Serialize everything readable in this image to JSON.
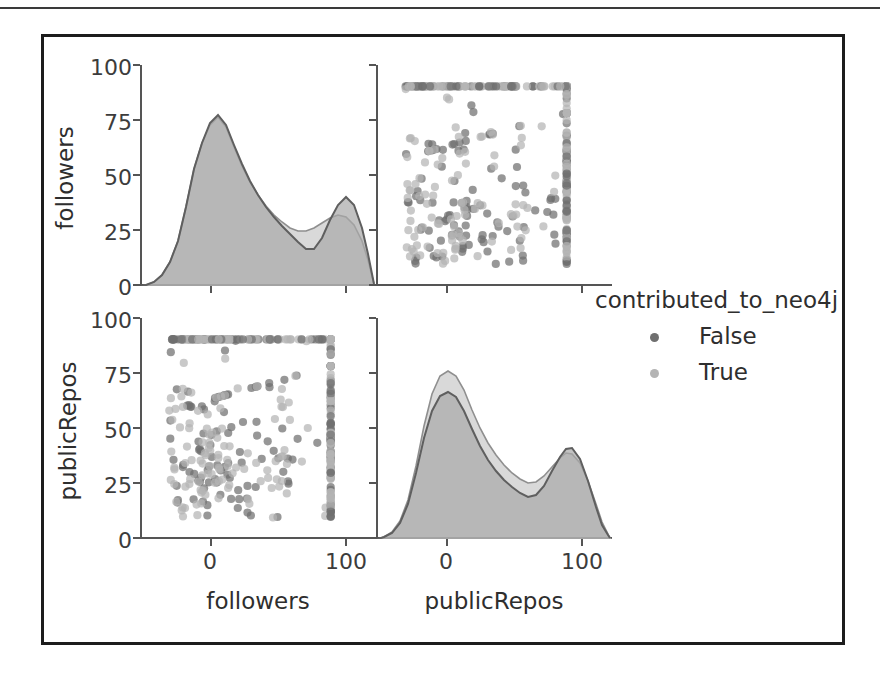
{
  "figure": {
    "kind": "seaborn-pairplot",
    "grid_rows": 2,
    "grid_cols": 2,
    "variables": [
      "followers",
      "publicRepos"
    ],
    "hue": "contributed_to_neo4j"
  },
  "legend": {
    "title": "contributed_to_neo4j",
    "entries": [
      {
        "label": "False",
        "color": "#6f6f6f",
        "marker": "circle"
      },
      {
        "label": "True",
        "color": "#b0b0b0",
        "marker": "circle"
      }
    ]
  },
  "axis_labels": {
    "bottom_left": "followers",
    "bottom_right": "publicRepos",
    "left_top": "followers",
    "left_bottom": "publicRepos"
  },
  "ticks": {
    "x_labels": [
      "0",
      "100"
    ],
    "x_values": [
      0,
      100
    ],
    "y_labels": [
      "0",
      "25",
      "50",
      "75",
      "100"
    ],
    "y_values": [
      0,
      25,
      50,
      75,
      100
    ]
  },
  "chart_data": [
    {
      "id": "panel-0-0",
      "type": "line",
      "subtype": "kde-filled",
      "title": "",
      "xlabel": "followers",
      "ylabel": "followers",
      "xlim": [
        -35,
        140
      ],
      "ylim": [
        0,
        110
      ],
      "grid": false,
      "legend_position": "right-outside",
      "x": [
        -35,
        -25,
        -15,
        -10,
        -5,
        0,
        5,
        10,
        15,
        20,
        25,
        30,
        35,
        40,
        45,
        50,
        55,
        60,
        65,
        70,
        75,
        80,
        85,
        90,
        95,
        100,
        105,
        110,
        115,
        120,
        130,
        140
      ],
      "series": [
        {
          "name": "False",
          "color": "#6f6f6f",
          "values": [
            0,
            1,
            4,
            9,
            20,
            42,
            78,
            99,
            101,
            92,
            78,
            65,
            55,
            47,
            41,
            36,
            31,
            26,
            21,
            16,
            13,
            13,
            18,
            27,
            36,
            40,
            36,
            26,
            15,
            8,
            2,
            0
          ]
        },
        {
          "name": "True",
          "color": "#b0b0b0",
          "values": [
            0,
            1,
            4,
            9,
            20,
            42,
            78,
            99,
            100,
            92,
            79,
            67,
            58,
            50,
            45,
            40,
            35,
            30,
            26,
            22,
            21,
            22,
            25,
            28,
            29,
            28,
            24,
            18,
            11,
            6,
            2,
            0
          ]
        }
      ]
    },
    {
      "id": "panel-0-1",
      "type": "scatter",
      "title": "",
      "xlabel": "publicRepos",
      "ylabel": "followers",
      "xlim": [
        -18,
        128
      ],
      "ylim": [
        -12,
        112
      ],
      "grid": false,
      "note": "values capped at 100 on both axes producing dense edge lines",
      "series": [
        {
          "name": "False",
          "color": "#6f6f6f",
          "n_points": 160
        },
        {
          "name": "True",
          "color": "#b0b0b0",
          "n_points": 170
        }
      ]
    },
    {
      "id": "panel-1-0",
      "type": "scatter",
      "title": "",
      "xlabel": "followers",
      "ylabel": "publicRepos",
      "xlim": [
        -18,
        128
      ],
      "ylim": [
        -12,
        112
      ],
      "grid": false,
      "note": "values capped at 100 on both axes producing dense edge lines",
      "series": [
        {
          "name": "False",
          "color": "#6f6f6f",
          "n_points": 160
        },
        {
          "name": "True",
          "color": "#b0b0b0",
          "n_points": 170
        }
      ]
    },
    {
      "id": "panel-1-1",
      "type": "line",
      "subtype": "kde-filled",
      "title": "",
      "xlabel": "publicRepos",
      "ylabel": "publicRepos",
      "xlim": [
        -35,
        140
      ],
      "ylim": [
        0,
        110
      ],
      "grid": false,
      "x": [
        -35,
        -25,
        -15,
        -10,
        -5,
        0,
        5,
        10,
        15,
        20,
        25,
        30,
        35,
        40,
        45,
        50,
        55,
        60,
        65,
        70,
        75,
        80,
        85,
        90,
        95,
        100,
        105,
        110,
        115,
        120,
        130,
        140
      ],
      "series": [
        {
          "name": "False",
          "color": "#6f6f6f",
          "values": [
            0,
            1,
            4,
            10,
            24,
            48,
            76,
            90,
            93,
            88,
            78,
            67,
            57,
            48,
            40,
            33,
            27,
            22,
            18,
            16,
            17,
            22,
            30,
            37,
            41,
            38,
            29,
            18,
            9,
            4,
            1,
            0
          ]
        },
        {
          "name": "True",
          "color": "#b0b0b0",
          "values": [
            0,
            1,
            5,
            12,
            28,
            55,
            86,
            100,
            102,
            95,
            84,
            72,
            61,
            51,
            42,
            35,
            29,
            24,
            21,
            20,
            22,
            26,
            31,
            34,
            34,
            30,
            22,
            13,
            6,
            2,
            1,
            0
          ]
        }
      ]
    }
  ]
}
